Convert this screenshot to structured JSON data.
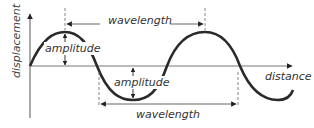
{
  "diagram": {
    "type": "transverse-wave",
    "axes": {
      "y_label": "displacement",
      "x_label": "distance"
    },
    "annotations": {
      "wavelength_top": "wavelength",
      "wavelength_bottom": "wavelength",
      "amplitude_crest": "amplitude",
      "amplitude_trough": "amplitude"
    },
    "colors": {
      "wave": "#2a2a2a",
      "axis": "#555555",
      "text": "#333333",
      "background": "#ffffff"
    }
  }
}
